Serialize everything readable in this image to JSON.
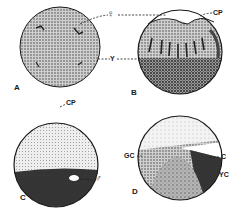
{
  "figure": {
    "panels": [
      {
        "id": "A",
        "label": "A"
      },
      {
        "id": "B",
        "label": "B"
      },
      {
        "id": "C",
        "label": "C"
      },
      {
        "id": "D",
        "label": "D"
      }
    ],
    "annotations": {
      "female": "♀",
      "y": "Y",
      "cp_b": "CP",
      "cp_c": "CP",
      "male": "♂",
      "c": "C",
      "yc": "YC",
      "gc": "GC"
    },
    "colors": {
      "ink": "#1a1a1a",
      "stipple_light": "#d9d9d9",
      "stipple_mid": "#a8a8a8",
      "stipple_dark": "#3a3a3a",
      "background": "#ffffff"
    }
  }
}
